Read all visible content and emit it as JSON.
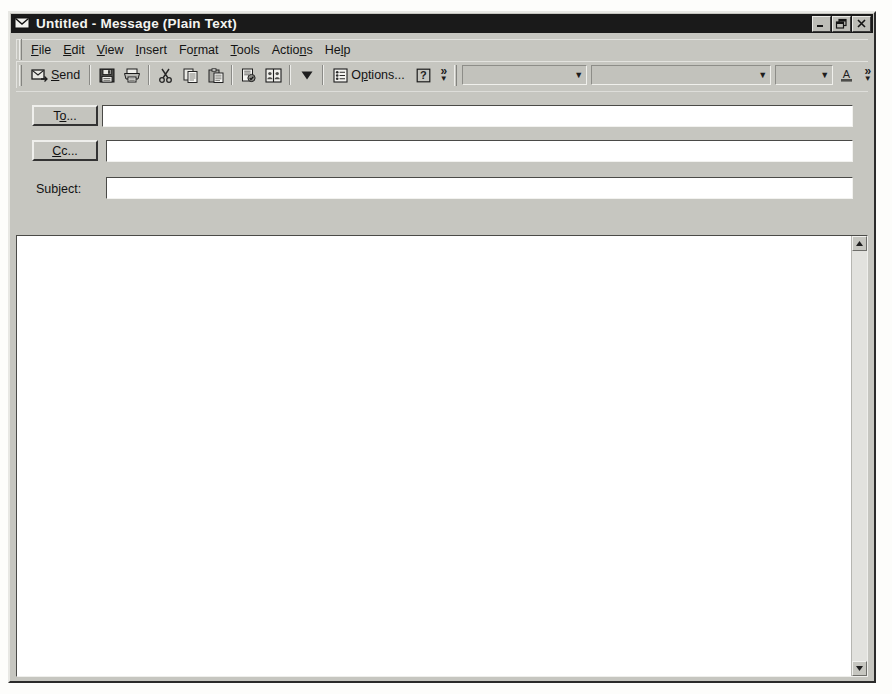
{
  "window": {
    "title": "Untitled - Message (Plain Text)",
    "title_icon": "envelope-icon",
    "minimize_label": "Minimize",
    "restore_label": "Restore",
    "close_label": "Close"
  },
  "menubar": {
    "items": [
      {
        "label": "File",
        "pre": "",
        "accel": "F",
        "post": "ile"
      },
      {
        "label": "Edit",
        "pre": "",
        "accel": "E",
        "post": "dit"
      },
      {
        "label": "View",
        "pre": "",
        "accel": "V",
        "post": "iew"
      },
      {
        "label": "Insert",
        "pre": "",
        "accel": "I",
        "post": "nsert"
      },
      {
        "label": "Format",
        "pre": "Fo",
        "accel": "r",
        "post": "mat"
      },
      {
        "label": "Tools",
        "pre": "",
        "accel": "T",
        "post": "ools"
      },
      {
        "label": "Actions",
        "pre": "Actio",
        "accel": "n",
        "post": "s"
      },
      {
        "label": "Help",
        "pre": "He",
        "accel": "l",
        "post": "p"
      }
    ]
  },
  "toolbar": {
    "send_label": "Send",
    "send_accel_pre": "",
    "send_accel": "S",
    "send_accel_post": "end",
    "options_label": "Options...",
    "options_pre": "O",
    "options_accel": "p",
    "options_post": "tions...",
    "buttons": [
      {
        "name": "send-button",
        "tooltip": "Send"
      },
      {
        "name": "save-button",
        "tooltip": "Save"
      },
      {
        "name": "print-button",
        "tooltip": "Print"
      },
      {
        "name": "cut-button",
        "tooltip": "Cut"
      },
      {
        "name": "copy-button",
        "tooltip": "Copy"
      },
      {
        "name": "paste-button",
        "tooltip": "Paste"
      },
      {
        "name": "check-names-button",
        "tooltip": "Check Names"
      },
      {
        "name": "address-book-button",
        "tooltip": "Address Book"
      },
      {
        "name": "flag-button",
        "tooltip": "Flag for Follow Up"
      },
      {
        "name": "options-button",
        "tooltip": "Options..."
      },
      {
        "name": "help-button",
        "tooltip": "Help"
      }
    ],
    "overflow_label": "»",
    "help_glyph": "?"
  },
  "formatbar": {
    "style_combo": {
      "value": "",
      "placeholder": ""
    },
    "font_combo": {
      "value": "",
      "placeholder": ""
    },
    "size_combo": {
      "value": "",
      "placeholder": ""
    },
    "font_color_label": "A",
    "overflow_label": "»"
  },
  "headers": {
    "to_button": {
      "pre": "T",
      "accel": "o",
      "post": "...",
      "label": "To..."
    },
    "cc_button": {
      "pre": "",
      "accel": "C",
      "post": "c...",
      "label": "Cc..."
    },
    "subject_label": "Subject:",
    "to_value": "",
    "cc_value": "",
    "subject_value": ""
  },
  "body": {
    "value": "",
    "placeholder": ""
  },
  "scrollbar": {
    "up_label": "▲",
    "down_label": "▼",
    "position": 0
  },
  "colors": {
    "face": "#c6c6c0",
    "titlebar": "#1a1a1a",
    "field": "#ffffff",
    "text": "#111111",
    "disabled_text": "#9a9a95"
  }
}
